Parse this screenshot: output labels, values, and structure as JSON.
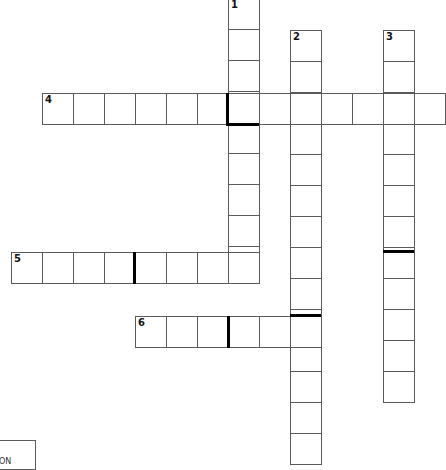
{
  "puzzle": {
    "cell_size": 31,
    "entries": [
      {
        "number": "1",
        "direction": "down",
        "x": 228,
        "y": -2,
        "length": 9
      },
      {
        "number": "2",
        "direction": "down",
        "x": 290,
        "y": 30,
        "length": 14
      },
      {
        "number": "3",
        "direction": "down",
        "x": 383,
        "y": 30,
        "length": 12
      },
      {
        "number": "4",
        "direction": "across",
        "x": 42,
        "y": 93,
        "length": 13
      },
      {
        "number": "5",
        "direction": "across",
        "x": 11,
        "y": 252,
        "length": 8
      },
      {
        "number": "6",
        "direction": "across",
        "x": 135,
        "y": 316,
        "length": 6
      }
    ],
    "word_breaks": [
      {
        "type": "v",
        "x": 226,
        "y": 93,
        "h": 33
      },
      {
        "type": "h",
        "x": 226,
        "y": 123,
        "w": 33
      },
      {
        "type": "v",
        "x": 133,
        "y": 252,
        "h": 32
      },
      {
        "type": "h",
        "x": 383,
        "y": 250,
        "w": 31
      },
      {
        "type": "h",
        "x": 290,
        "y": 314,
        "w": 31
      },
      {
        "type": "v",
        "x": 227,
        "y": 316,
        "h": 32
      }
    ]
  },
  "clue_box": {
    "text": "ON"
  }
}
